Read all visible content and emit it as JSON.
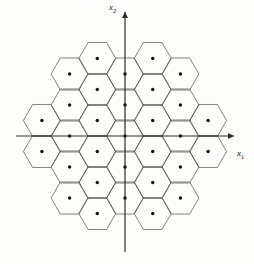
{
  "figure": {
    "name": "hexagonal-lattice-voronoi-diagram",
    "type": "diagram",
    "background_color": "#fdfdfc",
    "width": 254,
    "height": 264
  },
  "axes": {
    "x_axis": {
      "label": "x",
      "subscript": "1",
      "label_text": "x1",
      "orientation": "horizontal",
      "arrowhead": "right",
      "y_pixel": 136,
      "x_start": 16,
      "x_end": 234,
      "color": "#2b2b2b"
    },
    "y_axis": {
      "label": "x",
      "subscript": "2",
      "label_text": "x2",
      "orientation": "vertical",
      "arrowhead": "up",
      "x_pixel": 125,
      "y_start": 252,
      "y_end": 12,
      "color": "#2b2b2b"
    },
    "origin": {
      "x": 125,
      "y": 136
    }
  },
  "lattice": {
    "description": "hexagonal (honeycomb) point lattice with Voronoi cell boundaries",
    "cell_shape": "hexagon",
    "hexagon_orientation": "pointy-left-right",
    "column_spacing_px": 27.7,
    "row_spacing_px": 31.0,
    "row_offset_px": 15.5,
    "hexagon_circumradius_px": 18.5,
    "point_marker": {
      "shape": "filled-circle",
      "radius_px": 1.7,
      "color": "#111111"
    },
    "cell_border": {
      "color": "#4a4a4a",
      "width_px": 0.7
    },
    "clip_radius_px": 92,
    "columns": [
      {
        "index": -4,
        "cx": -110.8,
        "y_offset": 0,
        "count": 4
      },
      {
        "index": -3,
        "cx": -83.1,
        "y_offset": 15.5,
        "count": 5
      },
      {
        "index": -2,
        "cx": -55.4,
        "y_offset": 0,
        "count": 6
      },
      {
        "index": -1,
        "cx": -27.7,
        "y_offset": 15.5,
        "count": 7
      },
      {
        "index": 0,
        "cx": 0,
        "y_offset": 0,
        "count": 7
      },
      {
        "index": 1,
        "cx": 27.7,
        "y_offset": 15.5,
        "count": 7
      },
      {
        "index": 2,
        "cx": 55.4,
        "y_offset": 0,
        "count": 6
      },
      {
        "index": 3,
        "cx": 83.1,
        "y_offset": 15.5,
        "count": 5
      },
      {
        "index": 4,
        "cx": 110.8,
        "y_offset": 0,
        "count": 4
      }
    ]
  },
  "chart_data": {
    "type": "scatter",
    "title": "",
    "xlabel": "x1",
    "ylabel": "x2",
    "grid": false,
    "legend": null,
    "annotations": [],
    "note": "Lattice points of a 2-D hexagonal lattice with their Voronoi (hexagonal) regions drawn.",
    "points_lattice_units": [
      [
        -4,
        -1.5
      ],
      [
        -4,
        -0.5
      ],
      [
        -4,
        0.5
      ],
      [
        -4,
        1.5
      ],
      [
        -3,
        -2
      ],
      [
        -3,
        -1
      ],
      [
        -3,
        0
      ],
      [
        -3,
        1
      ],
      [
        -3,
        2
      ],
      [
        -2,
        -2.5
      ],
      [
        -2,
        -1.5
      ],
      [
        -2,
        -0.5
      ],
      [
        -2,
        0.5
      ],
      [
        -2,
        1.5
      ],
      [
        -2,
        2.5
      ],
      [
        -1,
        -3
      ],
      [
        -1,
        -2
      ],
      [
        -1,
        -1
      ],
      [
        -1,
        0
      ],
      [
        -1,
        1
      ],
      [
        -1,
        2
      ],
      [
        -1,
        3
      ],
      [
        0,
        -3.5
      ],
      [
        0,
        -2.5
      ],
      [
        0,
        -1.5
      ],
      [
        0,
        -0.5
      ],
      [
        0,
        0
      ],
      [
        0,
        0.5
      ],
      [
        0,
        1.5
      ],
      [
        0,
        2.5
      ],
      [
        0,
        3.5
      ],
      [
        1,
        -3
      ],
      [
        1,
        -2
      ],
      [
        1,
        -1
      ],
      [
        1,
        0
      ],
      [
        1,
        1
      ],
      [
        1,
        2
      ],
      [
        1,
        3
      ],
      [
        2,
        -2.5
      ],
      [
        2,
        -1.5
      ],
      [
        2,
        -0.5
      ],
      [
        2,
        0.5
      ],
      [
        2,
        1.5
      ],
      [
        2,
        2.5
      ],
      [
        3,
        -2
      ],
      [
        3,
        -1
      ],
      [
        3,
        0
      ],
      [
        3,
        1
      ],
      [
        3,
        2
      ],
      [
        4,
        -1.5
      ],
      [
        4,
        -0.5
      ],
      [
        4,
        0.5
      ],
      [
        4,
        1.5
      ]
    ]
  }
}
